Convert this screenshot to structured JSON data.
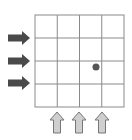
{
  "grid": {
    "rows": 4,
    "cols": 4,
    "x": 35,
    "y": 15,
    "width": 89,
    "height": 92,
    "line_color": "#8a8a8a"
  },
  "dot": {
    "row": 2,
    "col": 2,
    "cx": 96,
    "cy": 67,
    "r": 3.5,
    "color": "#555555"
  },
  "left_arrows": {
    "color": "#4a4a4a",
    "direction": "right",
    "rows_y": [
      38,
      61,
      83
    ],
    "x0": 8,
    "x1": 30
  },
  "bottom_arrows": {
    "fill": "#cfcfcf",
    "stroke": "#777777",
    "direction": "up",
    "cols_x": [
      57,
      79,
      102
    ],
    "y0": 112,
    "y1": 133
  }
}
